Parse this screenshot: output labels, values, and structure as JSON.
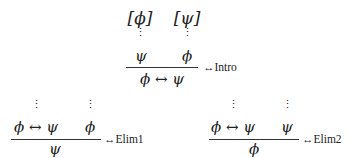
{
  "rules": {
    "intro": {
      "assumption_left": "[ϕ]",
      "assumption_right": "[ψ]",
      "dots": "⋮",
      "premise_left": "ψ",
      "premise_right": "ϕ",
      "conclusion": "ϕ ↔ ψ",
      "label": "↔Intro"
    },
    "elim1": {
      "dots": "⋮",
      "premise_left": "ϕ ↔ ψ",
      "premise_right": "ϕ",
      "conclusion": "ψ",
      "label": "↔Elim1"
    },
    "elim2": {
      "dots": "⋮",
      "premise_left": "ϕ ↔ ψ",
      "premise_right": "ψ",
      "conclusion": "ϕ",
      "label": "↔Elim2"
    }
  }
}
